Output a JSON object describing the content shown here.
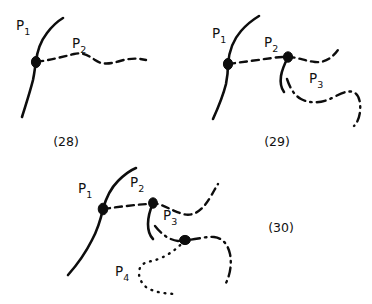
{
  "figure": {
    "background_color": "#ffffff",
    "ink_color": "#0d0d0d",
    "panels": [
      {
        "id": "panel-28",
        "caption": "(28)",
        "labels": [
          {
            "name": "P1",
            "base": "P",
            "sub": "1",
            "x": 16,
            "y": 26
          },
          {
            "name": "P2",
            "base": "P",
            "sub": "2",
            "x": 72,
            "y": 45
          }
        ],
        "curves": [
          {
            "name": "curve-P1",
            "style": "solid",
            "label": "P1"
          },
          {
            "name": "curve-P2",
            "style": "dashed",
            "label": "P2"
          }
        ],
        "nodes": [
          {
            "name": "node-P1-P2",
            "x": 36,
            "y": 62
          }
        ]
      },
      {
        "id": "panel-29",
        "caption": "(29)",
        "labels": [
          {
            "name": "P1",
            "base": "P",
            "sub": "1",
            "x": 212,
            "y": 34
          },
          {
            "name": "P2",
            "base": "P",
            "sub": "2",
            "x": 264,
            "y": 43
          },
          {
            "name": "P3",
            "base": "P",
            "sub": "3",
            "x": 309,
            "y": 79
          }
        ],
        "curves": [
          {
            "name": "curve-P1",
            "style": "solid",
            "label": "P1"
          },
          {
            "name": "curve-P2",
            "style": "dashed",
            "label": "P2"
          },
          {
            "name": "curve-P3",
            "style": "dash-dot",
            "label": "P3"
          }
        ],
        "nodes": [
          {
            "name": "node-P1-P2",
            "x": 228,
            "y": 64
          },
          {
            "name": "node-P2-P3",
            "x": 288,
            "y": 57
          }
        ]
      },
      {
        "id": "panel-30",
        "caption": "(30)",
        "labels": [
          {
            "name": "P1",
            "base": "P",
            "sub": "1",
            "x": 78,
            "y": 189
          },
          {
            "name": "P2",
            "base": "P",
            "sub": "2",
            "x": 130,
            "y": 183
          },
          {
            "name": "P3",
            "base": "P",
            "sub": "3",
            "x": 163,
            "y": 216
          },
          {
            "name": "P4",
            "base": "P",
            "sub": "4",
            "x": 115,
            "y": 272
          }
        ],
        "curves": [
          {
            "name": "curve-P1",
            "style": "solid",
            "label": "P1"
          },
          {
            "name": "curve-P2",
            "style": "dashed",
            "label": "P2"
          },
          {
            "name": "curve-P3",
            "style": "dash-dot",
            "label": "P3"
          },
          {
            "name": "curve-P4",
            "style": "dotted",
            "label": "P4"
          }
        ],
        "nodes": [
          {
            "name": "node-P1-P2",
            "x": 103,
            "y": 209
          },
          {
            "name": "node-P2-P3",
            "x": 153,
            "y": 203
          },
          {
            "name": "node-P3-P4",
            "x": 185,
            "y": 240
          }
        ]
      }
    ],
    "captions": {
      "c28": "(28)",
      "c29": "(29)",
      "c30": "(30)"
    },
    "label_text": {
      "p_base": "P",
      "sub1": "1",
      "sub2": "2",
      "sub3": "3",
      "sub4": "4"
    }
  }
}
